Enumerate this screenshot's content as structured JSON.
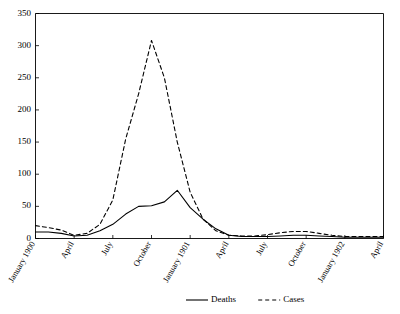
{
  "chart_data": {
    "type": "line",
    "title": "",
    "subtitle": "",
    "xlabel": "",
    "ylabel": "",
    "ylim": [
      0,
      350
    ],
    "ytick_labels": [
      "0",
      "50",
      "100",
      "150",
      "200",
      "250",
      "300",
      "350"
    ],
    "ytick_values": [
      0,
      50,
      100,
      150,
      200,
      250,
      300,
      350
    ],
    "grid": false,
    "legend_position": "bottom-center",
    "xtick_labels": [
      "January 1900",
      "April",
      "July",
      "October",
      "January 1901",
      "April",
      "July",
      "October",
      "January 1902",
      "April"
    ],
    "x": [
      "January 1900",
      "February 1900",
      "March 1900",
      "April 1900",
      "May 1900",
      "June 1900",
      "July 1900",
      "August 1900",
      "September 1900",
      "October 1900",
      "November 1900",
      "December 1900",
      "January 1901",
      "February 1901",
      "March 1901",
      "April 1901",
      "May 1901",
      "June 1901",
      "July 1901",
      "August 1901",
      "September 1901",
      "October 1901",
      "November 1901",
      "December 1901",
      "January 1902",
      "February 1902",
      "March 1902",
      "April 1902"
    ],
    "series": [
      {
        "name": "Deaths",
        "style": "solid",
        "color": "#000000",
        "values": [
          10,
          10,
          8,
          4,
          5,
          12,
          22,
          38,
          50,
          51,
          57,
          75,
          48,
          30,
          15,
          5,
          3,
          3,
          3,
          4,
          5,
          5,
          4,
          3,
          2,
          2,
          2,
          2
        ]
      },
      {
        "name": "Cases",
        "style": "dashed",
        "color": "#000000",
        "values": [
          20,
          17,
          13,
          5,
          8,
          22,
          60,
          155,
          225,
          308,
          250,
          150,
          72,
          30,
          12,
          5,
          4,
          4,
          6,
          9,
          11,
          11,
          8,
          5,
          3,
          3,
          3,
          3
        ]
      }
    ]
  },
  "legend": {
    "items": [
      {
        "label": "Deaths",
        "style": "solid"
      },
      {
        "label": "Cases",
        "style": "dashed"
      }
    ]
  }
}
